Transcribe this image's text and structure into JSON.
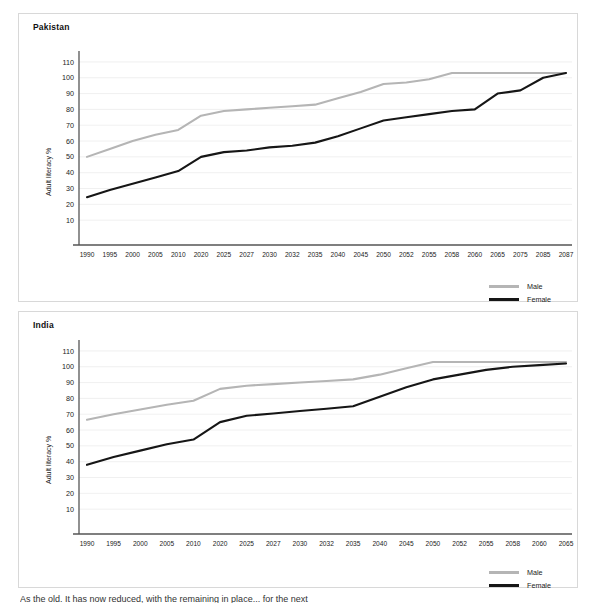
{
  "page": {
    "footer_text": "As the old. It has now reduced, with the remaining in place... for the next"
  },
  "legend": {
    "male_label": "Male",
    "female_label": "Female"
  },
  "axis": {
    "ylabel": "Adult literacy %",
    "yticks": [
      10,
      20,
      30,
      40,
      50,
      60,
      70,
      80,
      90,
      100,
      110
    ]
  },
  "chart_data": [
    {
      "type": "line",
      "title": "Pakistan",
      "xlabel": "",
      "ylabel": "Adult literacy %",
      "ylim": [
        0,
        115
      ],
      "grid": true,
      "legend_position": "bottom-right",
      "categories": [
        "1990",
        "1995",
        "2000",
        "2005",
        "2010",
        "2020",
        "2025",
        "2027",
        "2030",
        "2032",
        "2035",
        "2040",
        "2045",
        "2050",
        "2052",
        "2055",
        "2058",
        "2060",
        "2065",
        "2075",
        "2085",
        "2087"
      ],
      "series": [
        {
          "name": "Male",
          "color": "#b5b5b5",
          "values": [
            50,
            55,
            60,
            64,
            67,
            76,
            79,
            80,
            81,
            82,
            83,
            87,
            91,
            96,
            97,
            99,
            103,
            103,
            103,
            103,
            103,
            103
          ]
        },
        {
          "name": "Female",
          "color": "#161616",
          "values": [
            24.5,
            29,
            33,
            37,
            41,
            50,
            53,
            54,
            56,
            57,
            59,
            63,
            68,
            73,
            75,
            77,
            79,
            80,
            90,
            92,
            100,
            103
          ]
        }
      ]
    },
    {
      "type": "line",
      "title": "India",
      "xlabel": "",
      "ylabel": "Adult literacy %",
      "ylim": [
        0,
        115
      ],
      "grid": true,
      "legend_position": "bottom-right",
      "categories": [
        "1990",
        "1995",
        "2000",
        "2005",
        "2010",
        "2020",
        "2025",
        "2027",
        "2030",
        "2032",
        "2035",
        "2040",
        "2045",
        "2050",
        "2052",
        "2055",
        "2058",
        "2060",
        "2065"
      ],
      "series": [
        {
          "name": "Male",
          "color": "#b5b5b5",
          "values": [
            66.5,
            70,
            73,
            76,
            78.5,
            86,
            88,
            89,
            90,
            91,
            92,
            95,
            99,
            103,
            103,
            103,
            103,
            103,
            103
          ]
        },
        {
          "name": "Female",
          "color": "#161616",
          "values": [
            38,
            43,
            47,
            51,
            54,
            65,
            69,
            70.5,
            72,
            73.5,
            75,
            81,
            87,
            92,
            95,
            98,
            100,
            101,
            102
          ]
        }
      ]
    }
  ]
}
